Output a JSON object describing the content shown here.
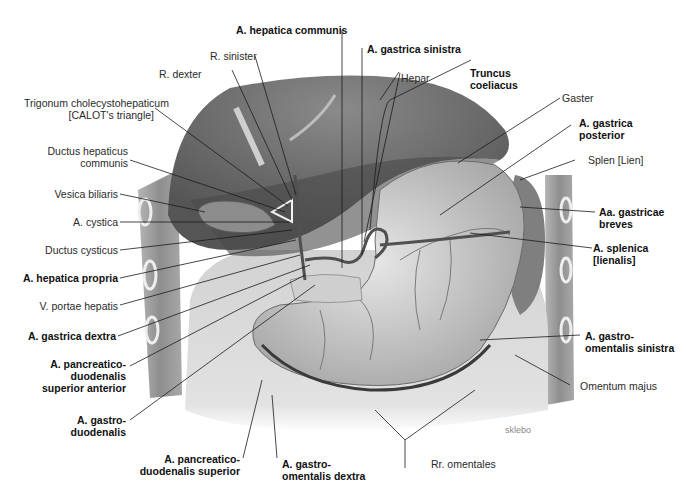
{
  "figure": {
    "watermark": "sklebo",
    "colors": {
      "background": "#ffffff",
      "leader_line": "#1a1a1a",
      "liver": "#6e6e6e",
      "liver_shadow": "#4a4a4a",
      "stomach": "#c9c9c9",
      "omentum": "#dcdcdc",
      "body_wall": "#9a9a9a",
      "gallbladder": "#8c8c8c",
      "spleen": "#7a7a7a",
      "vessel": "#5a5a5a"
    }
  },
  "labels": {
    "left": [
      {
        "id": "trigonum",
        "lines": [
          "Trigonum cholecystohepaticum",
          "[CALOT's triangle]"
        ],
        "bold": false
      },
      {
        "id": "ductus_hep_comm",
        "lines": [
          "Ductus hepaticus",
          "communis"
        ],
        "bold": false
      },
      {
        "id": "vesica_biliaris",
        "lines": [
          "Vesica biliaris"
        ],
        "bold": false
      },
      {
        "id": "a_cystica",
        "lines": [
          "A. cystica"
        ],
        "bold": false
      },
      {
        "id": "ductus_cysticus",
        "lines": [
          "Ductus cysticus"
        ],
        "bold": false
      },
      {
        "id": "a_hep_propria",
        "lines": [
          "A. hepatica propria"
        ],
        "bold": true
      },
      {
        "id": "v_portae",
        "lines": [
          "V. portae hepatis"
        ],
        "bold": false
      },
      {
        "id": "a_gastrica_dextra",
        "lines": [
          "A. gastrica dextra"
        ],
        "bold": true
      },
      {
        "id": "a_pd_sup_ant",
        "lines": [
          "A. pancreatico-",
          "duodenalis",
          "superior anterior"
        ],
        "bold": true
      },
      {
        "id": "a_gastroduod",
        "lines": [
          "A. gastro-",
          "duodenalis"
        ],
        "bold": true
      }
    ],
    "top": [
      {
        "id": "r_dexter",
        "lines": [
          "R. dexter"
        ],
        "bold": false
      },
      {
        "id": "r_sinister",
        "lines": [
          "R. sinister"
        ],
        "bold": false
      },
      {
        "id": "a_hep_comm",
        "lines": [
          "A. hepatica communis"
        ],
        "bold": true
      },
      {
        "id": "a_gastrica_sin",
        "lines": [
          "A. gastrica sinistra"
        ],
        "bold": true
      },
      {
        "id": "hepar",
        "lines": [
          "Hepar"
        ],
        "bold": false
      },
      {
        "id": "truncus",
        "lines": [
          "Truncus",
          "coeliacus"
        ],
        "bold": true
      }
    ],
    "right": [
      {
        "id": "gaster",
        "lines": [
          "Gaster"
        ],
        "bold": false
      },
      {
        "id": "a_gastrica_post",
        "lines": [
          "A. gastrica",
          "posterior"
        ],
        "bold": true
      },
      {
        "id": "splen",
        "lines": [
          "Splen [Lien]"
        ],
        "bold": false
      },
      {
        "id": "aa_gastricae_breves",
        "lines": [
          "Aa. gastricae",
          "breves"
        ],
        "bold": true
      },
      {
        "id": "a_splenica",
        "lines": [
          "A. splenica",
          "[lienalis]"
        ],
        "bold": true
      },
      {
        "id": "a_go_sin",
        "lines": [
          "A. gastro-",
          "omentalis sinistra"
        ],
        "bold": true
      },
      {
        "id": "omentum",
        "lines": [
          "Omentum majus"
        ],
        "bold": false
      }
    ],
    "bottom": [
      {
        "id": "a_pd_sup",
        "lines": [
          "A. pancreatico-",
          "duodenalis superior"
        ],
        "bold": true
      },
      {
        "id": "a_go_dex",
        "lines": [
          "A. gastro-",
          "omentalis dextra"
        ],
        "bold": true
      },
      {
        "id": "rr_omentales",
        "lines": [
          "Rr. omentales"
        ],
        "bold": false
      }
    ]
  }
}
